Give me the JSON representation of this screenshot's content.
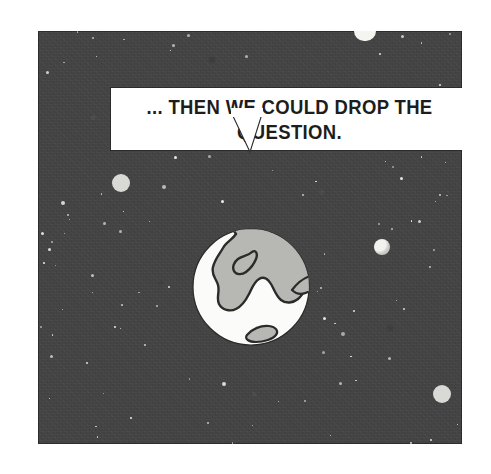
{
  "comic": {
    "panel_label": "comic panel",
    "background_color": "#434343",
    "ink_color": "#1d1d1d",
    "paper_color": "#ffffff",
    "land_color": "#b7b7b3",
    "planet_color": "#d9d9d6"
  },
  "balloon": {
    "text": "... THEN WE COULD DROP THE\nQUESTION.",
    "line1": "... THEN WE COULD DROP THE",
    "line2": "QUESTION.",
    "shape": "rectangular-speech-balloon",
    "tail_direction": "down"
  },
  "scene": {
    "earth": {
      "label": "earth-globe",
      "ocean_color": "#fbfbf9",
      "land_color": "#b7b7b3",
      "outline_color": "#2b2b2b"
    },
    "celestial_bodies": [
      {
        "name": "moon-top",
        "x": 316,
        "y": 31,
        "w": 22,
        "h": 10,
        "kind": "half-moon-clipped"
      },
      {
        "name": "planet-left",
        "x": 74,
        "y": 143,
        "r": 9,
        "kind": "plain"
      },
      {
        "name": "planet-right",
        "x": 336,
        "y": 208,
        "r": 8,
        "kind": "shaded"
      },
      {
        "name": "planet-lower-right",
        "x": 395,
        "y": 354,
        "r": 9,
        "kind": "plain"
      }
    ],
    "star_count": 96
  }
}
